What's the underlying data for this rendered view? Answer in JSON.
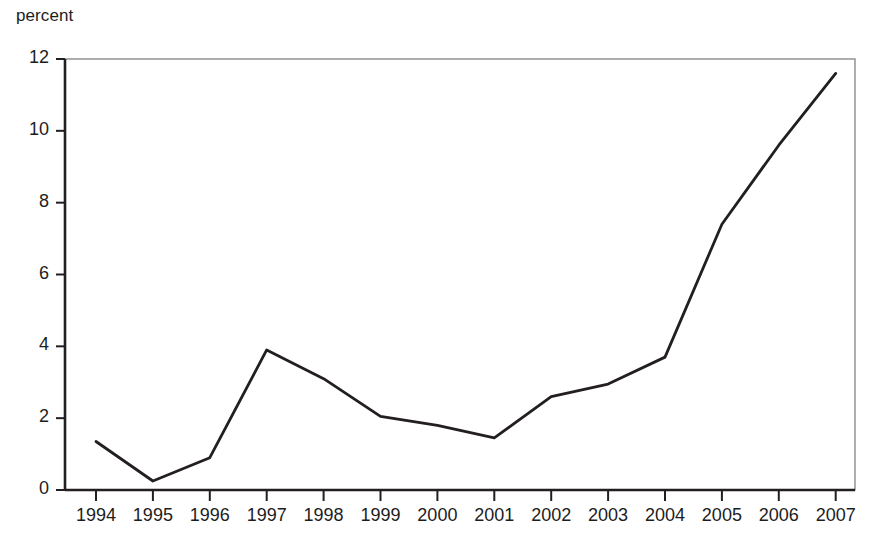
{
  "chart_data": {
    "type": "line",
    "title": "",
    "subtitle": "",
    "ylabel": "percent",
    "xlabel": "",
    "categories": [
      "1994",
      "1995",
      "1996",
      "1997",
      "1998",
      "1999",
      "2000",
      "2001",
      "2002",
      "2003",
      "2004",
      "2005",
      "2006",
      "2007"
    ],
    "x": [
      1994,
      1995,
      1996,
      1997,
      1998,
      1999,
      2000,
      2001,
      2002,
      2003,
      2004,
      2005,
      2006,
      2007
    ],
    "values": [
      1.35,
      0.25,
      0.9,
      3.9,
      3.1,
      2.05,
      1.8,
      1.45,
      2.6,
      2.95,
      3.7,
      7.4,
      9.6,
      11.6
    ],
    "series": [
      {
        "name": "percent",
        "values": [
          1.35,
          0.25,
          0.9,
          3.9,
          3.1,
          2.05,
          1.8,
          1.45,
          2.6,
          2.95,
          3.7,
          7.4,
          9.6,
          11.6
        ]
      }
    ],
    "ylim": [
      0,
      12
    ],
    "xlim": [
      1994,
      2007
    ],
    "yticks": [
      0,
      2,
      4,
      6,
      8,
      10,
      12
    ],
    "ytick_labels": [
      "0",
      "2",
      "4",
      "6",
      "8",
      "10",
      "12"
    ],
    "xticks": [
      1994,
      1995,
      1996,
      1997,
      1998,
      1999,
      2000,
      2001,
      2002,
      2003,
      2004,
      2005,
      2006,
      2007
    ],
    "xtick_labels": [
      "1994",
      "1995",
      "1996",
      "1997",
      "1998",
      "1999",
      "2000",
      "2001",
      "2002",
      "2003",
      "2004",
      "2005",
      "2006",
      "2007"
    ],
    "grid": false,
    "legend": false,
    "legend_position": "none",
    "annotations": [],
    "line_color": "#231f20",
    "axis_color": "#231f20",
    "frame_color": "#8c8c8c",
    "background_color": "#ffffff"
  }
}
